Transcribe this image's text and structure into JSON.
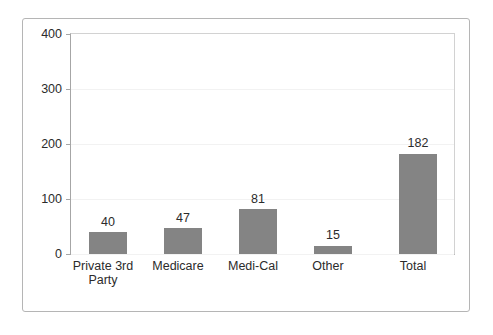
{
  "chart_data": {
    "type": "bar",
    "title": "",
    "subtitle": "",
    "xlabel": "",
    "ylabel": "",
    "categories": [
      "Private 3rd Party",
      "Medicare",
      "Medi-Cal",
      "Other",
      "Total"
    ],
    "values": [
      40,
      47,
      81,
      15,
      182
    ],
    "value_labels": [
      "40",
      "47",
      "81",
      "15",
      "182"
    ],
    "ytick_labels": [
      "0",
      "100",
      "200",
      "300",
      "400"
    ],
    "yticks": [
      0,
      100,
      200,
      300,
      400
    ],
    "ylim": [
      0,
      400
    ],
    "grid": true,
    "legend": null,
    "legend_position": "none",
    "bar_color": "#848484",
    "axis_color": "#a6a6a6",
    "gridline_color": "#f2f2f2",
    "border_color": "#b5b5b5",
    "text_color": "#2b2b2b",
    "background_color": "#ffffff"
  }
}
